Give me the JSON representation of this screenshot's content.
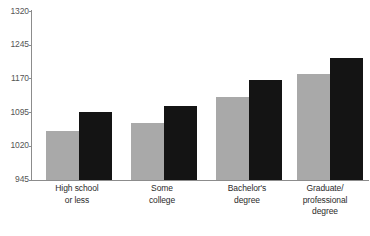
{
  "chart_data": {
    "type": "bar",
    "title": "",
    "xlabel": "",
    "ylabel": "",
    "categories": [
      "High school or less",
      "Some college",
      "Bachelor's degree",
      "Graduate/ professional degree"
    ],
    "category_lines": [
      [
        "High school",
        "or less"
      ],
      [
        "Some",
        "college"
      ],
      [
        "Bachelor's",
        "degree"
      ],
      [
        "Graduate/",
        "professional",
        "degree"
      ]
    ],
    "series": [
      {
        "name": "gray",
        "color": "#a9a9a9",
        "values": [
          1053,
          1071,
          1129,
          1178
        ]
      },
      {
        "name": "black",
        "color": "#141414",
        "values": [
          1095,
          1109,
          1165,
          1214
        ]
      }
    ],
    "ylim": [
      945,
      1320
    ],
    "yticks": [
      945,
      1020,
      1095,
      1170,
      1245,
      1320
    ],
    "ytick_labels": [
      "945",
      "1020",
      "1095",
      "1170",
      "1245",
      "1320"
    ],
    "grid": false,
    "legend": "none"
  },
  "axis": {
    "tick_color": "#8c8c8c",
    "label_color": "#555555"
  },
  "ticks": {
    "t0": "1320",
    "t1": "1245",
    "t2": "1170",
    "t3": "1095",
    "t4": "1020",
    "t5": "945"
  },
  "labels": {
    "g0l0": "High school",
    "g0l1": "or less",
    "g1l0": "Some",
    "g1l1": "college",
    "g2l0": "Bachelor's",
    "g2l1": "degree",
    "g3l0": "Graduate/",
    "g3l1": "professional",
    "g3l2": "degree"
  }
}
